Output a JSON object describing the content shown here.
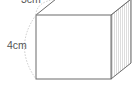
{
  "diagram": {
    "type": "rectangular-prism",
    "labels": {
      "top_edge": "3cm",
      "left_edge": "4cm"
    },
    "colors": {
      "stroke": "#6b6b6b",
      "hatch": "#c8c8c8",
      "dimension_arc": "#bdbdbd",
      "text": "#555555",
      "background": "#ffffff"
    }
  }
}
